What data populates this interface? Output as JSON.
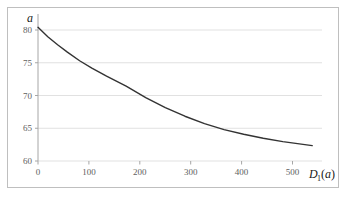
{
  "chart_data": {
    "type": "line",
    "title": "",
    "xlabel": "D_1(a)",
    "xlabel_parts": {
      "base": "D",
      "subscript": "1",
      "open_paren": "(",
      "arg": "a",
      "close_paren": ")"
    },
    "ylabel": "a",
    "xlim": [
      0,
      580
    ],
    "ylim": [
      60,
      82
    ],
    "xticks": [
      0,
      100,
      200,
      300,
      400,
      500
    ],
    "xtick_labels": [
      "0",
      "100",
      "200",
      "300",
      "400",
      "500"
    ],
    "yticks": [
      60,
      65,
      70,
      75,
      80
    ],
    "ytick_labels": [
      "60",
      "65",
      "70",
      "75",
      "80"
    ],
    "grid": true,
    "grid_axis": "y",
    "legend": "none",
    "series": [
      {
        "name": "a vs D1(a)",
        "color": "#333333",
        "linewidth": 1.4,
        "x": [
          0,
          20,
          40,
          60,
          85,
          110,
          140,
          180,
          220,
          260,
          300,
          340,
          380,
          420,
          460,
          500,
          530,
          560
        ],
        "y": [
          80.0,
          78.6,
          77.4,
          76.3,
          75.0,
          73.9,
          72.7,
          71.2,
          69.5,
          68.0,
          66.7,
          65.6,
          64.7,
          64.0,
          63.4,
          62.9,
          62.6,
          62.3
        ]
      }
    ],
    "colors": {
      "curve": "#333333",
      "grid": "#d9d9d9",
      "axis": "#a6a6a6",
      "frame": "#bfbfbf",
      "tick_text": "#606060",
      "title_text": "#202020",
      "background": "#ffffff"
    }
  }
}
